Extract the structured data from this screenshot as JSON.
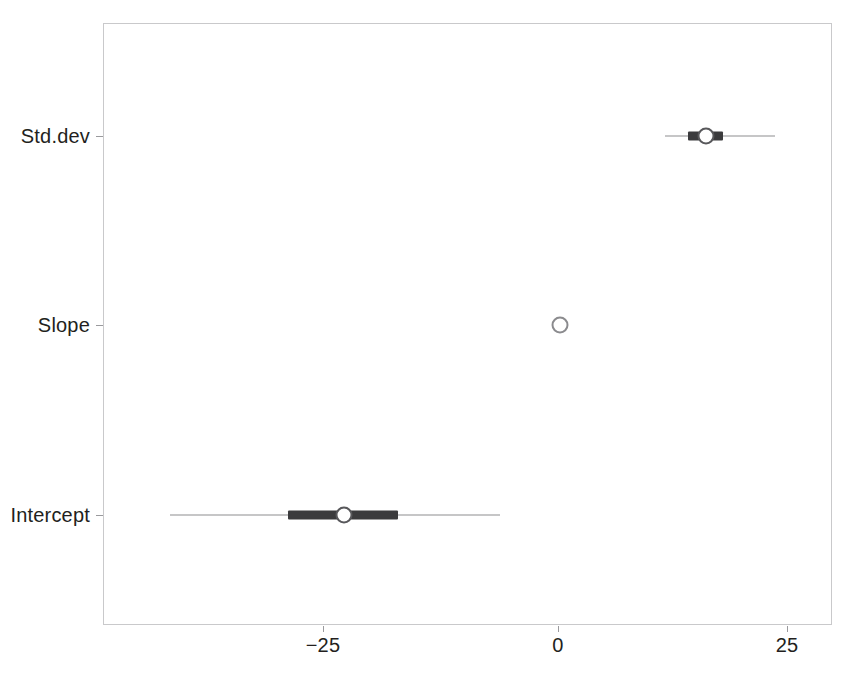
{
  "chart_data": {
    "type": "interval",
    "title": "",
    "xlabel": "",
    "ylabel": "",
    "grid": false,
    "legend": "none",
    "xlim": [
      -45,
      30
    ],
    "xticks": [
      -25,
      0,
      25
    ],
    "xticklabels": [
      "−25",
      "0",
      "25"
    ],
    "categories": [
      "Intercept",
      "Slope",
      "Std.dev"
    ],
    "series": [
      {
        "name": "Intercept",
        "point": -23.4,
        "inner_low": -29.5,
        "inner_high": -17.5,
        "outer_low": -42.4,
        "outer_high": -6.3
      },
      {
        "name": "Slope",
        "point": 0.2,
        "inner_low": 0.2,
        "inner_high": 0.2,
        "outer_low": 0.2,
        "outer_high": 0.2
      },
      {
        "name": "Std.dev",
        "point": 16.2,
        "inner_low": 14.2,
        "inner_high": 18.0,
        "outer_low": 11.7,
        "outer_high": 23.7
      }
    ]
  },
  "axes": {
    "y_labels": [
      {
        "label": "Std.dev"
      },
      {
        "label": "Slope"
      },
      {
        "label": "Intercept"
      }
    ],
    "x_labels": [
      {
        "label": "−25"
      },
      {
        "label": "0"
      },
      {
        "label": "25"
      }
    ]
  },
  "colors": {
    "frame": "#c9c9cb",
    "tick": "#9a9a9d",
    "outer_interval": "#8d8d90",
    "inner_interval": "#3b3b3d",
    "point_fill": "#ffffff",
    "point_stroke": "#58585b",
    "text": "#231f20",
    "background": "#ffffff"
  }
}
